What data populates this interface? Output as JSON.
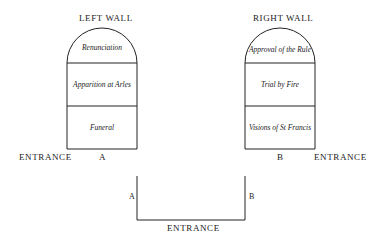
{
  "left_wall": {
    "title": "LEFT WALL",
    "panels": [
      "Renunciation",
      "Apparition at Arles",
      "Funeral"
    ],
    "marker": "A"
  },
  "right_wall": {
    "title": "RIGHT WALL",
    "panels": [
      "Approval of the Rule",
      "Trial by Fire",
      "Visions of St Francis"
    ],
    "marker": "B"
  },
  "entrance_left": "ENTRANCE",
  "entrance_right": "ENTRANCE",
  "plan": {
    "left_marker": "A",
    "right_marker": "B",
    "entrance": "ENTRANCE"
  },
  "colors": {
    "line": "#222222",
    "background": "#ffffff"
  }
}
